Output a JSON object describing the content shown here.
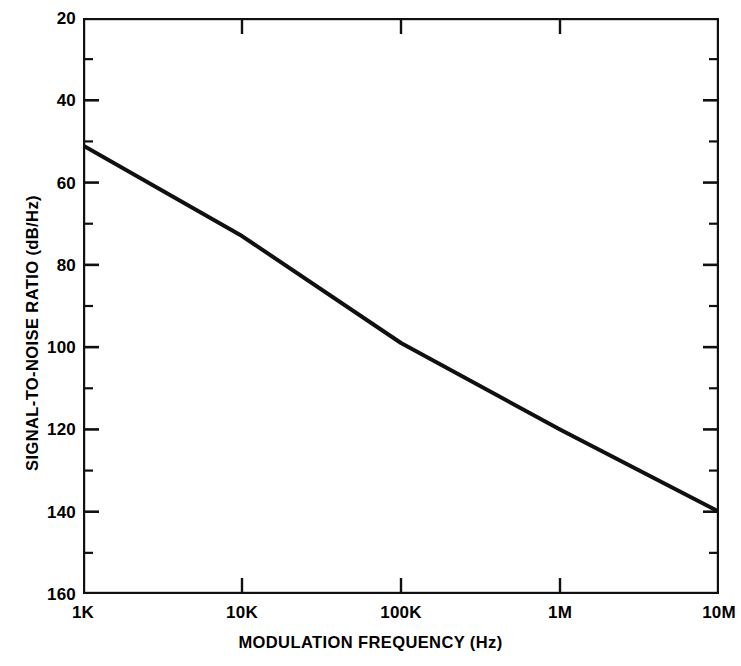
{
  "chart_data": {
    "type": "line",
    "title": "",
    "xlabel": "MODULATION FREQUENCY (Hz)",
    "ylabel": "SIGNAL-TO-NOISE RATIO  (dB/Hz)",
    "xscale": "log",
    "yscale": "linear",
    "xlim": [
      1000,
      10000000
    ],
    "ylim": [
      160,
      20
    ],
    "y_axis_inverted": true,
    "grid": false,
    "legend": null,
    "xticks": [
      {
        "value": 1000,
        "label": "1K"
      },
      {
        "value": 10000,
        "label": "10K"
      },
      {
        "value": 100000,
        "label": "100K"
      },
      {
        "value": 1000000,
        "label": "1M"
      },
      {
        "value": 10000000,
        "label": "10M"
      }
    ],
    "yticks": [
      {
        "value": 20,
        "label": "20",
        "major": true
      },
      {
        "value": 30,
        "label": "",
        "major": false
      },
      {
        "value": 40,
        "label": "40",
        "major": true
      },
      {
        "value": 50,
        "label": "",
        "major": false
      },
      {
        "value": 60,
        "label": "60",
        "major": true
      },
      {
        "value": 70,
        "label": "",
        "major": false
      },
      {
        "value": 80,
        "label": "80",
        "major": true
      },
      {
        "value": 90,
        "label": "",
        "major": false
      },
      {
        "value": 100,
        "label": "100",
        "major": true
      },
      {
        "value": 110,
        "label": "",
        "major": false
      },
      {
        "value": 120,
        "label": "120",
        "major": true
      },
      {
        "value": 130,
        "label": "",
        "major": false
      },
      {
        "value": 140,
        "label": "140",
        "major": true
      },
      {
        "value": 150,
        "label": "",
        "major": false
      },
      {
        "value": 160,
        "label": "160",
        "major": true
      }
    ],
    "series": [
      {
        "name": "signal-to-noise ratio",
        "color": "#101010",
        "line_width": 4,
        "points": [
          {
            "x": 1000,
            "y": 51
          },
          {
            "x": 10000,
            "y": 73
          },
          {
            "x": 100000,
            "y": 99
          },
          {
            "x": 1000000,
            "y": 120
          },
          {
            "x": 10000000,
            "y": 140
          }
        ]
      }
    ]
  },
  "axis_style": {
    "frame_color": "#101010",
    "tick_color": "#101010",
    "background": "#ffffff"
  }
}
